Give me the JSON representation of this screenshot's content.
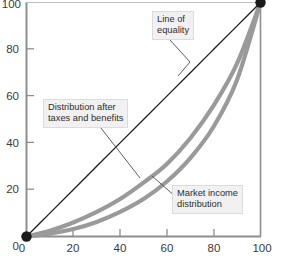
{
  "chart_data": {
    "type": "line",
    "title": "",
    "subtitle": "",
    "xlabel": "",
    "ylabel": "",
    "xlim": [
      0,
      100
    ],
    "ylim": [
      0,
      100
    ],
    "xticks": [
      0,
      20,
      40,
      60,
      80,
      100
    ],
    "yticks": [
      0,
      20,
      40,
      60,
      80,
      100
    ],
    "grid": false,
    "legend": "none (inline annotated callout labels)",
    "endpoint_markers": [
      {
        "x": 0,
        "y": 0,
        "color": "#1a1a1a",
        "shape": "filled-circle"
      },
      {
        "x": 100,
        "y": 100,
        "color": "#1a1a1a",
        "shape": "filled-circle"
      }
    ],
    "series": [
      {
        "name": "Line of equality",
        "style": "thin-solid-black-diagonal",
        "color": "#1a1a1a",
        "x": [
          0,
          10,
          20,
          30,
          40,
          50,
          60,
          70,
          80,
          90,
          100
        ],
        "values": [
          0,
          10,
          20,
          30,
          40,
          50,
          60,
          70,
          80,
          90,
          100
        ]
      },
      {
        "name": "Distribution after taxes and benefits",
        "style": "thick-solid-grey",
        "color": "#9a9a9a",
        "x": [
          0,
          10,
          20,
          30,
          40,
          50,
          60,
          70,
          80,
          90,
          100
        ],
        "values": [
          0,
          2.5,
          6,
          10.5,
          16,
          23,
          31,
          42,
          56,
          74,
          100
        ]
      },
      {
        "name": "Market income distribution",
        "style": "thick-solid-grey",
        "color": "#9a9a9a",
        "x": [
          0,
          10,
          20,
          30,
          40,
          50,
          60,
          70,
          80,
          90,
          100
        ],
        "values": [
          0,
          1.2,
          3.2,
          6.2,
          10.5,
          16,
          23.5,
          33.5,
          47,
          67,
          100
        ]
      }
    ],
    "annotations": [
      {
        "id": "equality",
        "text_lines": [
          "Line of equality"
        ],
        "target_series": "Line of equality"
      },
      {
        "id": "after-tax",
        "text_lines": [
          "Distribution after",
          "taxes and benefits"
        ],
        "target_series": "Distribution after taxes and benefits"
      },
      {
        "id": "market",
        "text_lines": [
          "Market income",
          "distribution"
        ],
        "target_series": "Market income distribution"
      }
    ]
  },
  "axes": {
    "x_tick_labels": [
      "0",
      "20",
      "40",
      "60",
      "80",
      "100"
    ],
    "y_tick_labels": [
      "0",
      "20",
      "40",
      "60",
      "80",
      "100"
    ],
    "axis_color": "#8e8e8e",
    "tick_color": "#8e8e8e"
  },
  "callouts": {
    "equality": {
      "line1": "Line of",
      "line2": "equality"
    },
    "after_tax": {
      "line1": "Distribution after",
      "line2": "taxes and benefits"
    },
    "market": {
      "line1": "Market income",
      "line2": "distribution"
    }
  },
  "colors": {
    "background": "#ffffff",
    "curve_grey": "#9a9a9a",
    "equality_black": "#1a1a1a",
    "callout_bg": "#f1f1f1",
    "callout_border": "#dcdcdc",
    "axis": "#8e8e8e"
  }
}
